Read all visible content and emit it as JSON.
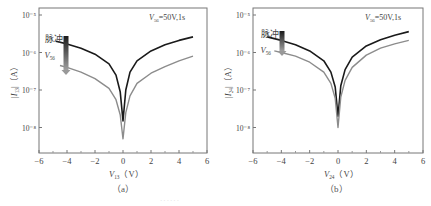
{
  "chart_data": [
    {
      "type": "line",
      "panel_label": "（a）",
      "annotation": "V56=50V,1s",
      "annotation_parts": {
        "var": "V",
        "sub": "56",
        "rest": "=50V,1s"
      },
      "xlabel": "V13（V）",
      "xlabel_parts": {
        "var": "V",
        "sub": "13",
        "unit": "（V）"
      },
      "ylabel": "|I13|（A）",
      "ylabel_parts": {
        "var": "|I",
        "sub": "13",
        "unit": "|（A）"
      },
      "xlim": [
        -6,
        6
      ],
      "xticks": [
        -6,
        -4,
        -2,
        0,
        2,
        4,
        6
      ],
      "yscale": "log",
      "ylim": [
        5e-09,
        1e-05
      ],
      "yticks": [
        "10⁻⁵",
        "10⁻⁶",
        "10⁻⁷",
        "10⁻⁸"
      ],
      "legend_arrow": {
        "top_label": "脉冲",
        "bottom_label": "V56",
        "bottom_parts": {
          "var": "V",
          "sub": "56"
        }
      },
      "series": [
        {
          "name": "before pulse",
          "color": "#1a1a1a",
          "x": [
            -4.8,
            -4,
            -3,
            -2,
            -1,
            -0.5,
            -0.2,
            0,
            0.2,
            0.5,
            1,
            2,
            3,
            4,
            5
          ],
          "y": [
            2e-06,
            1.7e-06,
            1.3e-06,
            9e-07,
            5e-07,
            2.5e-07,
            9e-08,
            1.5e-08,
            1e-07,
            3e-07,
            6e-07,
            1.1e-06,
            1.6e-06,
            2.1e-06,
            2.6e-06
          ]
        },
        {
          "name": "after pulse",
          "color": "#8c8c8c",
          "x": [
            -4.5,
            -4,
            -3,
            -2,
            -1,
            -0.5,
            -0.2,
            0,
            0.2,
            0.5,
            1,
            2,
            3,
            4,
            5
          ],
          "y": [
            4.5e-07,
            4e-07,
            3e-07,
            2e-07,
            1.1e-07,
            5.5e-08,
            2.2e-08,
            5e-09,
            2.5e-08,
            7e-08,
            1.5e-07,
            2.8e-07,
            4.2e-07,
            6e-07,
            8e-07
          ]
        }
      ]
    },
    {
      "type": "line",
      "panel_label": "（b）",
      "annotation": "V56=50V,1s",
      "annotation_parts": {
        "var": "V",
        "sub": "56",
        "rest": "=50V,1s"
      },
      "xlabel": "V24（V）",
      "xlabel_parts": {
        "var": "V",
        "sub": "24",
        "unit": "（V）"
      },
      "ylabel": "|I24|（A）",
      "ylabel_parts": {
        "var": "|I",
        "sub": "24",
        "unit": "|（A）"
      },
      "xlim": [
        -6,
        6
      ],
      "xticks": [
        -6,
        -4,
        -2,
        0,
        2,
        4,
        6
      ],
      "yscale": "log",
      "ylim": [
        5e-09,
        1e-05
      ],
      "yticks": [
        "10⁻⁵",
        "10⁻⁶",
        "10⁻⁷",
        "10⁻⁸"
      ],
      "legend_arrow": {
        "top_label": "脉冲",
        "bottom_label": "V56",
        "bottom_parts": {
          "var": "V",
          "sub": "56"
        }
      },
      "series": [
        {
          "name": "before pulse",
          "color": "#1a1a1a",
          "x": [
            -5,
            -4,
            -3,
            -2,
            -1,
            -0.5,
            -0.2,
            0,
            0.2,
            0.5,
            1,
            2,
            3,
            4,
            5
          ],
          "y": [
            2.6e-06,
            2.1e-06,
            1.6e-06,
            1.1e-06,
            6e-07,
            3e-07,
            1.2e-07,
            2e-08,
            1.3e-07,
            3.5e-07,
            7.5e-07,
            1.5e-06,
            2.2e-06,
            2.9e-06,
            3.6e-06
          ]
        },
        {
          "name": "after pulse",
          "color": "#8c8c8c",
          "x": [
            -4.5,
            -4,
            -3,
            -2,
            -1,
            -0.5,
            -0.2,
            0,
            0.2,
            0.5,
            1,
            2,
            3,
            4,
            5
          ],
          "y": [
            1.1e-06,
            1e-06,
            8e-07,
            5.5e-07,
            3e-07,
            1.5e-07,
            6e-08,
            1e-08,
            6.5e-08,
            1.8e-07,
            4e-07,
            8.5e-07,
            1.3e-06,
            1.7e-06,
            2.1e-06
          ]
        }
      ]
    }
  ],
  "caption_faint": "······"
}
